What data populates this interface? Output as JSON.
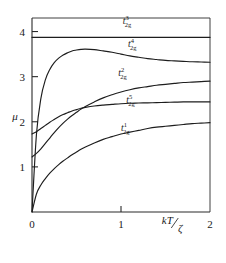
{
  "chart_data": {
    "type": "line",
    "title": "",
    "xlabel": "kT/ζ",
    "ylabel": "μ",
    "xlim": [
      0,
      2
    ],
    "ylim": [
      0,
      4.3
    ],
    "xticks": [
      0,
      1,
      2
    ],
    "xticklabels": [
      "0",
      "1",
      "2"
    ],
    "yticks": [
      1,
      2,
      3,
      4
    ],
    "yticklabels": [
      "1",
      "2",
      "3",
      "4"
    ],
    "grid": false,
    "legend": "inline-annotations",
    "x": [
      0.0,
      0.05,
      0.1,
      0.15,
      0.2,
      0.25,
      0.3,
      0.35,
      0.4,
      0.45,
      0.5,
      0.55,
      0.6,
      0.7,
      0.8,
      0.9,
      1.0,
      1.1,
      1.2,
      1.3,
      1.4,
      1.5,
      1.6,
      1.7,
      1.8,
      1.9,
      2.0
    ],
    "series": [
      {
        "name": "t2g3",
        "label": "t",
        "superscript": "3",
        "subscript": "2g",
        "label_x": 1.02,
        "label_y": 4.17,
        "values": [
          3.87,
          3.87,
          3.87,
          3.87,
          3.87,
          3.87,
          3.87,
          3.87,
          3.87,
          3.87,
          3.87,
          3.87,
          3.87,
          3.87,
          3.87,
          3.87,
          3.87,
          3.87,
          3.87,
          3.87,
          3.87,
          3.87,
          3.87,
          3.87,
          3.87,
          3.87,
          3.87
        ]
      },
      {
        "name": "t2g4",
        "label": "t",
        "superscript": "4",
        "subscript": "2g",
        "label_x": 1.08,
        "label_y": 3.66,
        "values": [
          0.0,
          1.72,
          2.52,
          2.93,
          3.16,
          3.31,
          3.41,
          3.48,
          3.53,
          3.57,
          3.59,
          3.605,
          3.61,
          3.6,
          3.57,
          3.54,
          3.5,
          3.46,
          3.43,
          3.4,
          3.38,
          3.36,
          3.35,
          3.34,
          3.33,
          3.325,
          3.32
        ]
      },
      {
        "name": "t2g2",
        "label": "t",
        "superscript": "2",
        "subscript": "2g",
        "label_x": 0.97,
        "label_y": 3.02,
        "values": [
          1.22,
          1.3,
          1.4,
          1.52,
          1.64,
          1.76,
          1.87,
          1.97,
          2.06,
          2.14,
          2.21,
          2.28,
          2.34,
          2.44,
          2.53,
          2.6,
          2.66,
          2.71,
          2.75,
          2.78,
          2.81,
          2.83,
          2.85,
          2.87,
          2.88,
          2.89,
          2.9
        ]
      },
      {
        "name": "t2g5",
        "label": "t",
        "superscript": "5",
        "subscript": "2g",
        "label_x": 1.06,
        "label_y": 2.42,
        "values": [
          1.73,
          1.78,
          1.85,
          1.92,
          1.99,
          2.05,
          2.11,
          2.16,
          2.2,
          2.24,
          2.27,
          2.3,
          2.32,
          2.35,
          2.37,
          2.385,
          2.4,
          2.41,
          2.415,
          2.42,
          2.425,
          2.43,
          2.435,
          2.44,
          2.44,
          2.44,
          2.44
        ]
      },
      {
        "name": "t2g1",
        "label": "t",
        "superscript": "1",
        "subscript": "2g",
        "label_x": 1.0,
        "label_y": 1.8,
        "values": [
          0.0,
          0.4,
          0.6,
          0.74,
          0.86,
          0.96,
          1.05,
          1.13,
          1.2,
          1.27,
          1.33,
          1.39,
          1.44,
          1.53,
          1.61,
          1.67,
          1.73,
          1.77,
          1.81,
          1.85,
          1.88,
          1.9,
          1.92,
          1.94,
          1.96,
          1.97,
          1.98
        ]
      }
    ]
  },
  "colors": {
    "curve": "#1d1d1d",
    "axis": "#2a2a2a",
    "background": "#ffffff"
  }
}
